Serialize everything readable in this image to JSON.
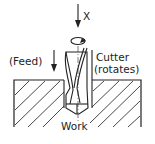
{
  "diagram": {
    "labels": {
      "axis": "X",
      "feed": "(Feed)",
      "cutter_line1": "Cutter",
      "cutter_line2": "(rotates)",
      "work": "Work"
    },
    "colors": {
      "ink": "#222222",
      "background": "#ffffff"
    }
  }
}
